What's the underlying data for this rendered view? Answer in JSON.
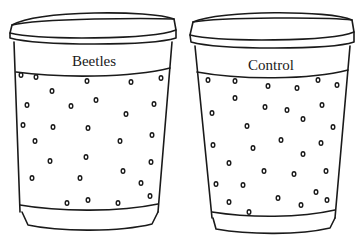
{
  "cups": [
    {
      "label": "Beetles",
      "dots": [
        [
          21,
          75
        ],
        [
          36,
          77
        ],
        [
          87,
          81
        ],
        [
          131,
          82
        ],
        [
          161,
          78
        ],
        [
          52,
          91
        ],
        [
          27,
          105
        ],
        [
          96,
          100
        ],
        [
          71,
          106
        ],
        [
          154,
          104
        ],
        [
          126,
          114
        ],
        [
          23,
          125
        ],
        [
          53,
          127
        ],
        [
          88,
          128
        ],
        [
          35,
          141
        ],
        [
          120,
          141
        ],
        [
          152,
          135
        ],
        [
          50,
          161
        ],
        [
          86,
          157
        ],
        [
          151,
          162
        ],
        [
          123,
          171
        ],
        [
          32,
          178
        ],
        [
          80,
          178
        ],
        [
          141,
          183
        ],
        [
          150,
          196
        ],
        [
          88,
          200
        ],
        [
          67,
          203
        ],
        [
          118,
          203
        ]
      ]
    },
    {
      "label": "Control",
      "dots": [
        [
          208,
          80
        ],
        [
          235,
          81
        ],
        [
          268,
          86
        ],
        [
          297,
          88
        ],
        [
          318,
          80
        ],
        [
          337,
          85
        ],
        [
          235,
          98
        ],
        [
          265,
          107
        ],
        [
          287,
          110
        ],
        [
          212,
          113
        ],
        [
          322,
          105
        ],
        [
          303,
          119
        ],
        [
          247,
          126
        ],
        [
          333,
          127
        ],
        [
          213,
          145
        ],
        [
          253,
          148
        ],
        [
          281,
          140
        ],
        [
          321,
          143
        ],
        [
          303,
          154
        ],
        [
          229,
          163
        ],
        [
          264,
          171
        ],
        [
          294,
          174
        ],
        [
          326,
          171
        ],
        [
          216,
          184
        ],
        [
          243,
          185
        ],
        [
          316,
          192
        ],
        [
          278,
          198
        ],
        [
          327,
          200
        ],
        [
          229,
          202
        ],
        [
          249,
          212
        ],
        [
          301,
          205
        ]
      ]
    }
  ]
}
